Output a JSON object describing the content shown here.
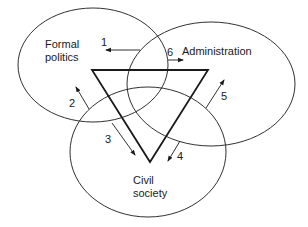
{
  "diagram": {
    "circles": [
      {
        "id": "formal-politics",
        "label_lines": [
          "Formal",
          "politics"
        ]
      },
      {
        "id": "administration",
        "label_lines": [
          "Administration"
        ]
      },
      {
        "id": "civil-society",
        "label_lines": [
          "Civil",
          "society"
        ]
      }
    ],
    "arrows": [
      {
        "number": "1"
      },
      {
        "number": "2"
      },
      {
        "number": "3"
      },
      {
        "number": "4"
      },
      {
        "number": "5"
      },
      {
        "number": "6"
      }
    ],
    "colors": {
      "stroke": "#1a1a1a",
      "background": "#ffffff"
    }
  }
}
